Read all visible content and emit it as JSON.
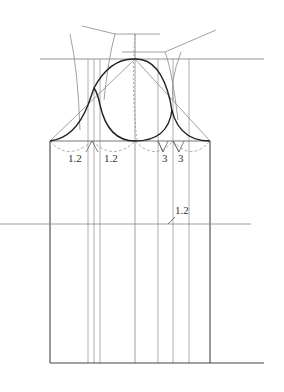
{
  "diagram": {
    "type": "pattern-drafting",
    "colors": {
      "frame": "#444444",
      "guide": "#888888",
      "curve": "#222222",
      "dashed": "#999999",
      "label": "#333333"
    },
    "labels": {
      "left_dart_1": "1.2",
      "left_dart_2": "1.2",
      "right_dart_1": "3",
      "right_dart_2": "3",
      "mid_marker": "1.2"
    }
  }
}
